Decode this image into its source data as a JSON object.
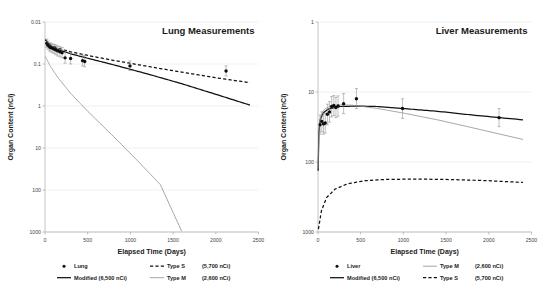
{
  "figure": {
    "panel_count": 2
  },
  "panels": [
    {
      "id": "lung",
      "title": "Lung Measurements",
      "xlabel": "Elapsed Time (Days)",
      "ylabel": "Organ Content (nCi)",
      "xticks": [
        "0",
        "500",
        "1000",
        "1500",
        "2000",
        "2500"
      ],
      "yticks": [
        "1000",
        "100",
        "10",
        "1",
        "0.1",
        "0.01"
      ],
      "legend": [
        {
          "key": "lung-marker",
          "style": "marker",
          "label": "Lung",
          "value": ""
        },
        {
          "key": "type-s",
          "style": "dashed",
          "label": "Type S",
          "value": "(5,700 nCi)"
        },
        {
          "key": "modified",
          "style": "solid",
          "label": "Modified (6,500 nCi)",
          "value": ""
        },
        {
          "key": "type-m",
          "style": "thin",
          "label": "Type M",
          "value": "(2,600 nCi)"
        }
      ]
    },
    {
      "id": "liver",
      "title": "Liver Measurements",
      "xlabel": "Elapsed Time (Days)",
      "ylabel": "Organ Content (nCi)",
      "xticks": [
        "0",
        "500",
        "1000",
        "1500",
        "2000",
        "2500"
      ],
      "yticks": [
        "1000",
        "100",
        "10",
        "1"
      ],
      "legend": [
        {
          "key": "liver-marker",
          "style": "marker",
          "label": "Liver",
          "value": ""
        },
        {
          "key": "type-m",
          "style": "thin",
          "label": "Type M",
          "value": "(2,600 nCi)"
        },
        {
          "key": "modified",
          "style": "solid",
          "label": "Modified (6,500 nCi)",
          "value": ""
        },
        {
          "key": "type-s",
          "style": "dashed",
          "label": "Type S",
          "value": "(5,700 nCi)"
        }
      ]
    }
  ],
  "chart_data": [
    {
      "type": "scatter",
      "id": "lung",
      "title": "Lung Measurements",
      "xlabel": "Elapsed Time (Days)",
      "ylabel": "Organ Content (nCi)",
      "xlim": [
        0,
        2500
      ],
      "ylim": [
        0.01,
        1000
      ],
      "yscale": "log",
      "xscale": "linear",
      "grid": true,
      "legend_position": "below",
      "xticks": [
        0,
        500,
        1000,
        1500,
        2000,
        2500
      ],
      "yticks": [
        0.01,
        0.1,
        1,
        10,
        100,
        1000
      ],
      "series": [
        {
          "name": "Lung",
          "type": "scatter",
          "marker": "filled-circle",
          "errorbars": true,
          "points": [
            {
              "x": 20,
              "y": 310,
              "ylow": 250,
              "yhigh": 390
            },
            {
              "x": 35,
              "y": 280,
              "ylow": 225,
              "yhigh": 350
            },
            {
              "x": 55,
              "y": 255,
              "ylow": 205,
              "yhigh": 320
            },
            {
              "x": 70,
              "y": 245,
              "ylow": 195,
              "yhigh": 310
            },
            {
              "x": 90,
              "y": 235,
              "ylow": 185,
              "yhigh": 300
            },
            {
              "x": 110,
              "y": 225,
              "ylow": 175,
              "yhigh": 290
            },
            {
              "x": 130,
              "y": 215,
              "ylow": 165,
              "yhigh": 280
            },
            {
              "x": 150,
              "y": 205,
              "ylow": 155,
              "yhigh": 270
            },
            {
              "x": 175,
              "y": 195,
              "ylow": 148,
              "yhigh": 258
            },
            {
              "x": 200,
              "y": 185,
              "ylow": 140,
              "yhigh": 248
            },
            {
              "x": 235,
              "y": 140,
              "ylow": 105,
              "yhigh": 190
            },
            {
              "x": 300,
              "y": 135,
              "ylow": 100,
              "yhigh": 185
            },
            {
              "x": 440,
              "y": 120,
              "ylow": 90,
              "yhigh": 162
            },
            {
              "x": 465,
              "y": 115,
              "ylow": 86,
              "yhigh": 156
            },
            {
              "x": 995,
              "y": 90,
              "ylow": 70,
              "yhigh": 118
            },
            {
              "x": 2120,
              "y": 68,
              "ylow": 52,
              "yhigh": 90
            }
          ]
        },
        {
          "name": "Modified (6,500 nCi)",
          "type": "line",
          "linestyle": "solid",
          "points": [
            {
              "x": 5,
              "y": 380
            },
            {
              "x": 60,
              "y": 275
            },
            {
              "x": 150,
              "y": 222
            },
            {
              "x": 300,
              "y": 175
            },
            {
              "x": 500,
              "y": 137
            },
            {
              "x": 800,
              "y": 96
            },
            {
              "x": 1200,
              "y": 58
            },
            {
              "x": 1600,
              "y": 34
            },
            {
              "x": 2000,
              "y": 19
            },
            {
              "x": 2400,
              "y": 10.5
            }
          ]
        },
        {
          "name": "Type S (5,700 nCi)",
          "type": "line",
          "linestyle": "dashed",
          "points": [
            {
              "x": 5,
              "y": 380
            },
            {
              "x": 60,
              "y": 285
            },
            {
              "x": 150,
              "y": 238
            },
            {
              "x": 300,
              "y": 195
            },
            {
              "x": 500,
              "y": 160
            },
            {
              "x": 800,
              "y": 122
            },
            {
              "x": 1200,
              "y": 88
            },
            {
              "x": 1600,
              "y": 64
            },
            {
              "x": 2000,
              "y": 47
            },
            {
              "x": 2400,
              "y": 36
            }
          ]
        },
        {
          "name": "Type M (2,600 nCi)",
          "type": "line",
          "linestyle": "thin",
          "points": [
            {
              "x": 5,
              "y": 150
            },
            {
              "x": 60,
              "y": 90
            },
            {
              "x": 150,
              "y": 48
            },
            {
              "x": 300,
              "y": 20
            },
            {
              "x": 500,
              "y": 7.5
            },
            {
              "x": 800,
              "y": 1.9
            },
            {
              "x": 1100,
              "y": 0.46
            },
            {
              "x": 1350,
              "y": 0.135
            },
            {
              "x": 1600,
              "y": 0.0105
            }
          ]
        }
      ]
    },
    {
      "type": "scatter",
      "id": "liver",
      "title": "Liver Measurements",
      "xlabel": "Elapsed Time (Days)",
      "ylabel": "Organ Content (nCi)",
      "xlim": [
        0,
        2500
      ],
      "ylim": [
        1,
        1000
      ],
      "yscale": "log",
      "xscale": "linear",
      "grid": true,
      "legend_position": "below",
      "xticks": [
        0,
        500,
        1000,
        1500,
        2000,
        2500
      ],
      "yticks": [
        1,
        10,
        100,
        1000
      ],
      "series": [
        {
          "name": "Liver",
          "type": "scatter",
          "marker": "filled-circle",
          "errorbars": true,
          "points": [
            {
              "x": 25,
              "y": 34,
              "ylow": 25,
              "yhigh": 47
            },
            {
              "x": 45,
              "y": 38,
              "ylow": 27,
              "yhigh": 52
            },
            {
              "x": 65,
              "y": 35,
              "ylow": 25,
              "yhigh": 49
            },
            {
              "x": 85,
              "y": 36,
              "ylow": 26,
              "yhigh": 50
            },
            {
              "x": 110,
              "y": 48,
              "ylow": 34,
              "yhigh": 67
            },
            {
              "x": 135,
              "y": 52,
              "ylow": 37,
              "yhigh": 73
            },
            {
              "x": 160,
              "y": 62,
              "ylow": 44,
              "yhigh": 86
            },
            {
              "x": 185,
              "y": 64,
              "ylow": 46,
              "yhigh": 89
            },
            {
              "x": 210,
              "y": 60,
              "ylow": 43,
              "yhigh": 84
            },
            {
              "x": 235,
              "y": 63,
              "ylow": 45,
              "yhigh": 88
            },
            {
              "x": 300,
              "y": 68,
              "ylow": 49,
              "yhigh": 95
            },
            {
              "x": 450,
              "y": 80,
              "ylow": 58,
              "yhigh": 112
            },
            {
              "x": 990,
              "y": 58,
              "ylow": 42,
              "yhigh": 80
            },
            {
              "x": 2120,
              "y": 43,
              "ylow": 32,
              "yhigh": 58
            }
          ]
        },
        {
          "name": "Modified (6,500 nCi)",
          "type": "line",
          "linestyle": "solid",
          "points": [
            {
              "x": 2,
              "y": 7.5
            },
            {
              "x": 10,
              "y": 26
            },
            {
              "x": 25,
              "y": 40
            },
            {
              "x": 60,
              "y": 50
            },
            {
              "x": 120,
              "y": 57
            },
            {
              "x": 250,
              "y": 62
            },
            {
              "x": 450,
              "y": 63
            },
            {
              "x": 700,
              "y": 62
            },
            {
              "x": 1000,
              "y": 58
            },
            {
              "x": 1400,
              "y": 53
            },
            {
              "x": 1800,
              "y": 47
            },
            {
              "x": 2400,
              "y": 40
            }
          ]
        },
        {
          "name": "Type M (2,600 nCi)",
          "type": "line",
          "linestyle": "thin",
          "points": [
            {
              "x": 2,
              "y": 8
            },
            {
              "x": 12,
              "y": 30
            },
            {
              "x": 30,
              "y": 45
            },
            {
              "x": 70,
              "y": 56
            },
            {
              "x": 140,
              "y": 63
            },
            {
              "x": 280,
              "y": 66
            },
            {
              "x": 450,
              "y": 64
            },
            {
              "x": 700,
              "y": 58
            },
            {
              "x": 1000,
              "y": 50
            },
            {
              "x": 1400,
              "y": 40
            },
            {
              "x": 1800,
              "y": 31
            },
            {
              "x": 2400,
              "y": 21
            }
          ]
        },
        {
          "name": "Type S (5,700 nCi)",
          "type": "line",
          "linestyle": "dashed",
          "points": [
            {
              "x": 5,
              "y": 1.1
            },
            {
              "x": 40,
              "y": 2.0
            },
            {
              "x": 100,
              "y": 3.1
            },
            {
              "x": 200,
              "y": 4.1
            },
            {
              "x": 350,
              "y": 4.9
            },
            {
              "x": 550,
              "y": 5.4
            },
            {
              "x": 800,
              "y": 5.65
            },
            {
              "x": 1200,
              "y": 5.7
            },
            {
              "x": 1600,
              "y": 5.6
            },
            {
              "x": 2000,
              "y": 5.4
            },
            {
              "x": 2400,
              "y": 5.1
            }
          ]
        }
      ]
    }
  ]
}
